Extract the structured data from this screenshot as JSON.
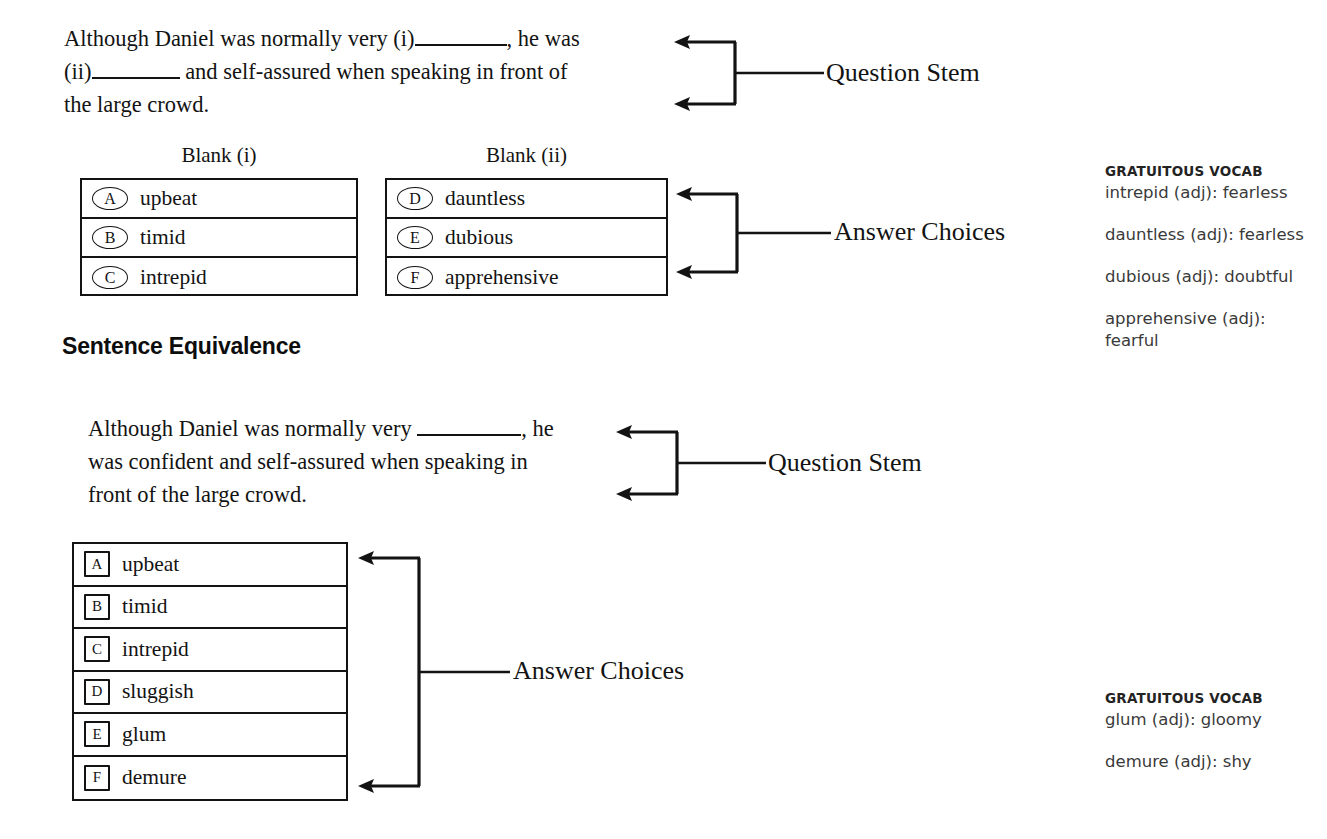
{
  "page": {
    "section_heading": "Sentence Equivalence"
  },
  "text_completion": {
    "stem_parts": {
      "p1": "Although Daniel was normally very (i)",
      "p2": ", he was\n(ii)",
      "p3": " and self-assured when speaking in front of\nthe large crowd."
    },
    "stem_plain": "Although Daniel was normally very (i)______, he was (ii)______ and self-assured when speaking in front of the large crowd.",
    "columns": [
      {
        "header": "Blank (i)",
        "choices": [
          {
            "letter": "A",
            "text": "upbeat"
          },
          {
            "letter": "B",
            "text": "timid"
          },
          {
            "letter": "C",
            "text": "intrepid"
          }
        ]
      },
      {
        "header": "Blank (ii)",
        "choices": [
          {
            "letter": "D",
            "text": "dauntless"
          },
          {
            "letter": "E",
            "text": "dubious"
          },
          {
            "letter": "F",
            "text": "apprehensive"
          }
        ]
      }
    ],
    "annotations": {
      "stem_label": "Question Stem",
      "choices_label": "Answer Choices"
    }
  },
  "sentence_equivalence": {
    "stem_parts": {
      "p1": "Although Daniel was normally very ",
      "p2": ", he\nwas confident and self-assured when speaking in\nfront of the large crowd."
    },
    "stem_plain": "Although Daniel was normally very ______, he was confident and self-assured when speaking in front of the large crowd.",
    "choices": [
      {
        "letter": "A",
        "text": "upbeat"
      },
      {
        "letter": "B",
        "text": "timid"
      },
      {
        "letter": "C",
        "text": "intrepid"
      },
      {
        "letter": "D",
        "text": "sluggish"
      },
      {
        "letter": "E",
        "text": "glum"
      },
      {
        "letter": "F",
        "text": "demure"
      }
    ],
    "annotations": {
      "stem_label": "Question Stem",
      "choices_label": "Answer Choices"
    }
  },
  "vocab_top": {
    "title": "GRATUITOUS VOCAB",
    "entries": [
      "intrepid (adj): fearless",
      "dauntless (adj): fearless",
      "dubious (adj): doubtful",
      "apprehensive (adj): fearful"
    ]
  },
  "vocab_bottom": {
    "title": "GRATUITOUS VOCAB",
    "entries": [
      "glum (adj): gloomy",
      "demure (adj): shy"
    ]
  },
  "colors": {
    "ink": "#131313",
    "vocab_ink": "#3a3a3a",
    "background": "#ffffff"
  }
}
